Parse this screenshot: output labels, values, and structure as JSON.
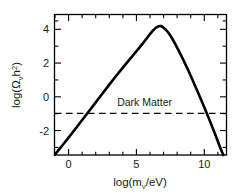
{
  "figure": {
    "background_color": "#ffffff",
    "line_color": "#000000",
    "frame_color": "#000000"
  },
  "chart_data": {
    "type": "line",
    "title": "",
    "xlabel": "log(m_ν/eV)",
    "xlabel_parts": {
      "pre": "log(m",
      "sub": "ν",
      "post": "/eV)"
    },
    "ylabel": "log(Ω_ν h²)",
    "ylabel_parts": {
      "pre": "log(",
      "omega": "Ω",
      "sub1": "ν",
      "h": "h",
      "sup": "2",
      "post": ")"
    },
    "xlim": [
      -1.0,
      11.6
    ],
    "ylim": [
      -3.45,
      4.85
    ],
    "xticks": [
      0,
      5,
      10
    ],
    "xtick_labels": [
      "0",
      "5",
      "10"
    ],
    "xticks_minor": [
      -1,
      1,
      2,
      3,
      4,
      6,
      7,
      8,
      9,
      11
    ],
    "yticks": [
      -2,
      0,
      2,
      4
    ],
    "ytick_labels": [
      "-2",
      "0",
      "2",
      "4"
    ],
    "yticks_minor": [
      -3,
      -1,
      1,
      3,
      4.5
    ],
    "grid": false,
    "legend": "none",
    "series": [
      {
        "name": "omega_nu_h2",
        "style": "solid",
        "width": 2.6,
        "color": "#000000",
        "points": [
          [
            -1.0,
            -3.42
          ],
          [
            -0.5,
            -2.92
          ],
          [
            0.0,
            -2.42
          ],
          [
            0.5,
            -1.9
          ],
          [
            1.0,
            -1.38
          ],
          [
            1.5,
            -0.86
          ],
          [
            2.0,
            -0.33
          ],
          [
            2.5,
            0.2
          ],
          [
            3.0,
            0.72
          ],
          [
            3.5,
            1.23
          ],
          [
            4.0,
            1.73
          ],
          [
            4.5,
            2.22
          ],
          [
            5.0,
            2.7
          ],
          [
            5.5,
            3.2
          ],
          [
            6.0,
            3.72
          ],
          [
            6.3,
            4.0
          ],
          [
            6.6,
            4.17
          ],
          [
            6.8,
            4.19
          ],
          [
            7.0,
            4.1
          ],
          [
            7.3,
            3.86
          ],
          [
            7.6,
            3.5
          ],
          [
            8.0,
            2.92
          ],
          [
            8.4,
            2.28
          ],
          [
            8.8,
            1.6
          ],
          [
            9.2,
            0.88
          ],
          [
            9.6,
            0.14
          ],
          [
            10.0,
            -0.62
          ],
          [
            10.4,
            -1.4
          ],
          [
            10.8,
            -2.22
          ],
          [
            11.2,
            -3.06
          ],
          [
            11.4,
            -3.45
          ]
        ]
      }
    ],
    "annotations": [
      {
        "type": "hline",
        "name": "dark-matter-line",
        "y": -0.98,
        "style": "dashed",
        "color": "#000000",
        "width": 1.2,
        "label": "Dark Matter",
        "label_x": 5.6,
        "label_y": -0.55
      }
    ]
  }
}
